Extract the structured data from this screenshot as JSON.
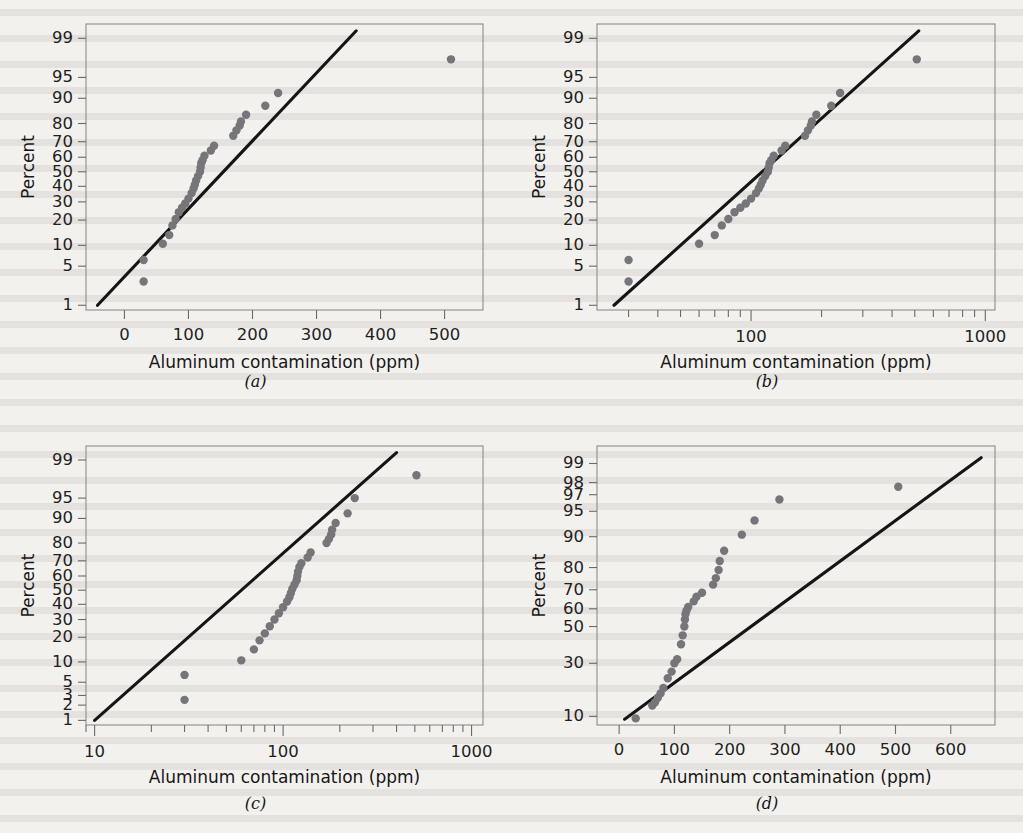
{
  "figure": {
    "background_color": "#f3f1ee",
    "point_color": "#76767a",
    "line_color": "#151515",
    "frame_color": "#8d8d8d"
  },
  "panels": [
    {
      "id": "a",
      "caption": "(a)",
      "chart_data": {
        "type": "scatter",
        "title": "",
        "xlabel": "Aluminum contamination (ppm)",
        "ylabel": "Percent",
        "xscale": "linear",
        "yscale": "probability",
        "grid": false,
        "legend": "none",
        "xlim": [
          -60,
          560
        ],
        "xticks": [
          0,
          100,
          200,
          300,
          400,
          500
        ],
        "xticklabels": [
          "0",
          "100",
          "200",
          "300",
          "400",
          "500"
        ],
        "yticks": [
          1,
          5,
          10,
          20,
          30,
          40,
          50,
          60,
          70,
          80,
          90,
          95,
          99
        ],
        "yticklabels": [
          "1",
          "5",
          "10",
          "20",
          "30",
          "40",
          "50",
          "60",
          "70",
          "80",
          "90",
          "95",
          "99"
        ],
        "ylim": [
          0.8,
          99.5
        ],
        "x": [
          30,
          30,
          60,
          70,
          75,
          80,
          85,
          90,
          95,
          100,
          105,
          108,
          110,
          112,
          115,
          118,
          119,
          120,
          122,
          125,
          135,
          140,
          170,
          175,
          180,
          182,
          190,
          220,
          240,
          510
        ],
        "y": [
          2.8,
          6.2,
          10.5,
          13.5,
          17.5,
          20.5,
          24.0,
          26.5,
          29.0,
          32.0,
          35.5,
          38.5,
          41.0,
          44.0,
          47.0,
          50.0,
          53.0,
          56.0,
          58.0,
          61.0,
          64.5,
          67.5,
          73.5,
          76.5,
          79.0,
          81.0,
          84.0,
          87.5,
          91.5,
          97.5
        ],
        "fit_line": {
          "x": [
            -42,
            362
          ],
          "y": [
            1.0,
            99.3
          ]
        }
      }
    },
    {
      "id": "b",
      "caption": "(b)",
      "chart_data": {
        "type": "scatter",
        "title": "",
        "xlabel": "Aluminum contamination (ppm)",
        "ylabel": "Percent",
        "xscale": "log",
        "yscale": "probability",
        "grid": false,
        "legend": "none",
        "xlim": [
          22,
          1100
        ],
        "xticks": [
          30,
          40,
          50,
          60,
          70,
          80,
          90,
          100,
          200,
          300,
          400,
          500,
          600,
          700,
          800,
          900,
          1000
        ],
        "xticklabels_shown": [
          "100",
          "1000"
        ],
        "xlabeled_ticks": [
          100,
          1000
        ],
        "yticks": [
          1,
          5,
          10,
          20,
          30,
          40,
          50,
          60,
          70,
          80,
          90,
          95,
          99
        ],
        "yticklabels": [
          "1",
          "5",
          "10",
          "20",
          "30",
          "40",
          "50",
          "60",
          "70",
          "80",
          "90",
          "95",
          "99"
        ],
        "ylim": [
          0.8,
          99.5
        ],
        "x": [
          30,
          30,
          60,
          70,
          75,
          80,
          85,
          90,
          95,
          100,
          105,
          108,
          110,
          112,
          115,
          118,
          119,
          120,
          122,
          125,
          135,
          140,
          170,
          175,
          180,
          182,
          190,
          220,
          240,
          510
        ],
        "y": [
          2.8,
          6.2,
          10.5,
          13.5,
          17.5,
          20.5,
          24.0,
          26.5,
          29.0,
          32.0,
          35.5,
          38.5,
          41.0,
          44.0,
          47.0,
          50.0,
          53.0,
          56.0,
          58.0,
          61.0,
          64.5,
          67.5,
          73.5,
          76.5,
          79.0,
          81.0,
          84.0,
          87.5,
          91.5,
          97.5
        ],
        "fit_line": {
          "x": [
            26,
            520
          ],
          "y": [
            1.0,
            99.3
          ]
        }
      }
    },
    {
      "id": "c",
      "caption": "(c)",
      "chart_data": {
        "type": "scatter",
        "title": "",
        "xlabel": "Aluminum contamination (ppm)",
        "ylabel": "Percent",
        "xscale": "log",
        "yscale": "probability",
        "grid": false,
        "legend": "none",
        "xlim": [
          9,
          1150
        ],
        "xticks": [
          10,
          20,
          30,
          40,
          50,
          60,
          70,
          80,
          90,
          100,
          200,
          300,
          400,
          500,
          600,
          700,
          800,
          900,
          1000
        ],
        "xlabeled_ticks": [
          10,
          100,
          1000
        ],
        "xticklabels_shown": [
          "10",
          "100",
          "1000"
        ],
        "yticks": [
          1,
          2,
          3,
          5,
          10,
          20,
          30,
          40,
          50,
          60,
          70,
          80,
          90,
          95,
          99
        ],
        "yticklabels": [
          "1",
          "2",
          "3",
          "5",
          "10",
          "20",
          "30",
          "40",
          "50",
          "60",
          "70",
          "80",
          "90",
          "95",
          "99"
        ],
        "ylim": [
          0.8,
          99.5
        ],
        "x": [
          30,
          30,
          60,
          70,
          75,
          80,
          85,
          90,
          95,
          100,
          105,
          108,
          110,
          112,
          115,
          118,
          119,
          120,
          122,
          125,
          135,
          140,
          170,
          175,
          180,
          182,
          190,
          220,
          240,
          510
        ],
        "y": [
          2.5,
          6.5,
          10.5,
          14.5,
          18.5,
          22.0,
          26.0,
          30.0,
          34.0,
          38.0,
          42.0,
          45.0,
          48.0,
          51.0,
          54.0,
          57.0,
          60.0,
          63.0,
          66.0,
          68.5,
          72.0,
          75.0,
          80.0,
          82.0,
          84.0,
          86.0,
          88.5,
          91.5,
          95.0,
          98.0
        ],
        "fit_line": {
          "x": [
            10,
            400
          ],
          "y": [
            1.0,
            99.3
          ]
        }
      }
    },
    {
      "id": "d",
      "caption": "(d)",
      "chart_data": {
        "type": "scatter",
        "title": "",
        "xlabel": "Aluminum contamination (ppm)",
        "ylabel": "Percent",
        "xscale": "linear",
        "yscale": "probability",
        "grid": false,
        "legend": "none",
        "xlim": [
          -40,
          680
        ],
        "xticks": [
          0,
          100,
          200,
          300,
          400,
          500,
          600
        ],
        "xticklabels": [
          "0",
          "100",
          "200",
          "300",
          "400",
          "500",
          "600"
        ],
        "yticks": [
          10,
          30,
          50,
          60,
          70,
          80,
          90,
          95,
          97,
          98,
          99
        ],
        "yticklabels": [
          "10",
          "30",
          "50",
          "60",
          "70",
          "80",
          "90",
          "95",
          "97",
          "98",
          "99"
        ],
        "ylim": [
          8,
          99.5
        ],
        "x": [
          30,
          60,
          65,
          70,
          75,
          80,
          88,
          95,
          100,
          105,
          112,
          115,
          118,
          119,
          120,
          122,
          125,
          135,
          140,
          150,
          170,
          175,
          180,
          182,
          190,
          222,
          245,
          290,
          505
        ],
        "y": [
          9.5,
          13.0,
          14.0,
          15.5,
          17.0,
          19.0,
          23.0,
          26.0,
          30.0,
          32.0,
          40.0,
          45.0,
          50.0,
          54.0,
          57.0,
          59.0,
          61.0,
          64.0,
          66.5,
          68.5,
          72.5,
          75.5,
          79.0,
          82.5,
          86.0,
          90.5,
          93.5,
          96.5,
          97.7
        ],
        "fit_line": {
          "x": [
            10,
            655
          ],
          "y": [
            9.3,
            99.2
          ]
        }
      }
    }
  ]
}
